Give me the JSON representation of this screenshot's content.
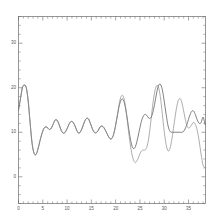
{
  "chart_data": {
    "type": "line",
    "title": "",
    "subtitle": "",
    "xlabel": "",
    "ylabel": "",
    "xlim": [
      0,
      38.5
    ],
    "ylim": [
      -6,
      36
    ],
    "grid": false,
    "legend": null,
    "x_ticks": [
      0,
      5,
      10,
      15,
      20,
      25,
      30,
      35
    ],
    "x_tick_labels": [
      "0",
      "5",
      "10",
      "15",
      "20",
      "25",
      "30",
      "35"
    ],
    "x_minor_interval": 1,
    "y_ticks": [
      0,
      10,
      20,
      30
    ],
    "y_tick_labels": [
      "0",
      "10",
      "20",
      "30"
    ],
    "y_minor_interval": 2,
    "frame": {
      "top": true,
      "right": true,
      "bottom": true,
      "left": true
    },
    "colors": {
      "series_a": "#4a4a4a",
      "series_b": "#8a8a8a",
      "axis": "#6a6a6a",
      "background": "#ffffff"
    },
    "series": [
      {
        "name": "series-a",
        "color": "#4a4a4a",
        "x": [
          0.0,
          0.4,
          0.8,
          1.2,
          1.6,
          2.0,
          2.4,
          2.8,
          3.2,
          3.6,
          4.0,
          4.4,
          4.8,
          5.2,
          5.6,
          6.0,
          6.4,
          6.8,
          7.2,
          7.6,
          8.0,
          8.4,
          8.8,
          9.2,
          9.6,
          10.0,
          10.4,
          10.8,
          11.2,
          11.6,
          12.0,
          12.4,
          12.8,
          13.2,
          13.6,
          14.0,
          14.4,
          14.8,
          15.2,
          15.6,
          16.0,
          16.4,
          16.8,
          17.2,
          17.6,
          18.0,
          18.4,
          18.8,
          19.2,
          19.6,
          20.0,
          20.4,
          20.8,
          21.2,
          21.6,
          22.0,
          22.4,
          22.8,
          23.2,
          23.6,
          24.0,
          24.4,
          24.8,
          25.2,
          25.6,
          26.0,
          26.4,
          26.8,
          27.2,
          27.6,
          28.0,
          28.4,
          28.8,
          29.2,
          29.6,
          30.0,
          30.4,
          30.8,
          31.2,
          31.6,
          32.0,
          32.4,
          32.8,
          33.2,
          33.6,
          34.0,
          34.4,
          34.8,
          35.2,
          35.6,
          36.0,
          36.4,
          36.8,
          37.2,
          37.6,
          38.0,
          38.4
        ],
        "y": [
          15.0,
          17.5,
          20.0,
          20.6,
          20.0,
          17.0,
          12.0,
          7.5,
          5.3,
          5.0,
          6.2,
          8.0,
          9.6,
          10.8,
          11.2,
          11.0,
          10.6,
          11.0,
          12.0,
          12.8,
          12.6,
          11.6,
          10.4,
          9.8,
          10.0,
          10.8,
          11.8,
          12.4,
          12.3,
          11.5,
          10.4,
          9.8,
          10.2,
          11.2,
          12.4,
          13.1,
          13.0,
          12.0,
          10.8,
          10.0,
          9.9,
          10.4,
          11.2,
          11.4,
          11.0,
          10.2,
          9.3,
          8.6,
          8.6,
          9.6,
          11.6,
          14.0,
          16.2,
          17.4,
          17.2,
          15.6,
          13.0,
          10.0,
          7.6,
          6.4,
          6.6,
          8.0,
          10.0,
          12.0,
          13.4,
          14.0,
          13.8,
          13.2,
          13.2,
          14.2,
          16.2,
          18.6,
          20.4,
          20.8,
          19.6,
          17.0,
          14.0,
          11.4,
          10.2,
          10.0,
          10.0,
          10.0,
          10.0,
          10.0,
          10.0,
          10.2,
          11.0,
          12.2,
          13.6,
          14.6,
          14.8,
          14.0,
          12.8,
          12.0,
          12.2,
          13.4,
          11.8
        ]
      },
      {
        "name": "series-b",
        "color": "#8a8a8a",
        "x": [
          0.0,
          0.4,
          0.8,
          1.2,
          1.6,
          2.0,
          2.4,
          2.8,
          3.2,
          3.6,
          4.0,
          4.4,
          4.8,
          5.2,
          5.6,
          6.0,
          6.4,
          6.8,
          7.2,
          7.6,
          8.0,
          8.4,
          8.8,
          9.2,
          9.6,
          10.0,
          10.4,
          10.8,
          11.2,
          11.6,
          12.0,
          12.4,
          12.8,
          13.2,
          13.6,
          14.0,
          14.4,
          14.8,
          15.2,
          15.6,
          16.0,
          16.4,
          16.8,
          17.2,
          17.6,
          18.0,
          18.4,
          18.8,
          19.2,
          19.6,
          20.0,
          20.4,
          20.8,
          21.2,
          21.6,
          22.0,
          22.4,
          22.8,
          23.2,
          23.6,
          24.0,
          24.4,
          24.8,
          25.2,
          25.6,
          26.0,
          26.4,
          26.8,
          27.2,
          27.6,
          28.0,
          28.4,
          28.8,
          29.2,
          29.6,
          30.0,
          30.4,
          30.8,
          31.2,
          31.6,
          32.0,
          32.4,
          32.8,
          33.2,
          33.6,
          34.0,
          34.4,
          34.8,
          35.2,
          35.6,
          36.0,
          36.4,
          36.8,
          37.2,
          37.6,
          38.0,
          38.4
        ],
        "y": [
          15.0,
          17.5,
          20.0,
          20.6,
          20.0,
          17.0,
          12.0,
          7.5,
          5.3,
          5.0,
          6.2,
          8.0,
          9.6,
          10.8,
          11.2,
          11.0,
          10.6,
          11.0,
          12.0,
          12.8,
          12.6,
          11.6,
          10.4,
          9.8,
          10.0,
          10.8,
          11.8,
          12.4,
          12.3,
          11.5,
          10.4,
          9.8,
          10.2,
          11.2,
          12.4,
          13.1,
          13.0,
          12.0,
          10.8,
          10.0,
          9.9,
          10.4,
          11.2,
          11.4,
          11.0,
          10.2,
          9.3,
          8.6,
          8.6,
          9.6,
          11.6,
          14.2,
          16.8,
          18.2,
          18.0,
          16.0,
          12.6,
          9.0,
          6.0,
          4.0,
          3.2,
          3.6,
          4.6,
          5.6,
          6.0,
          6.0,
          6.6,
          8.6,
          12.0,
          15.8,
          18.8,
          20.4,
          20.2,
          18.0,
          14.2,
          10.2,
          7.2,
          5.8,
          6.4,
          8.6,
          11.6,
          14.6,
          16.8,
          17.6,
          16.8,
          14.8,
          12.6,
          11.2,
          11.0,
          11.6,
          12.2,
          11.8,
          10.4,
          8.0,
          5.0,
          2.6,
          2.0
        ]
      }
    ]
  }
}
